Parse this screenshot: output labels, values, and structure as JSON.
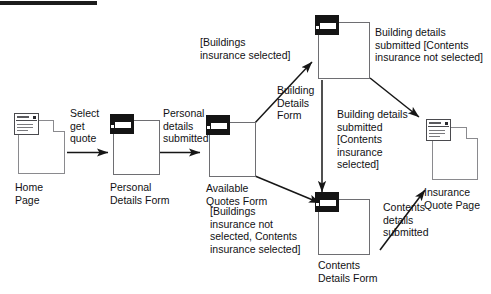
{
  "diagram": {
    "type": "navigation-state-diagram",
    "stroke_color": "#161616",
    "node_border_color": "#6e6e72",
    "badge_fill_color": "#141414",
    "background_color": "#ffffff"
  },
  "nodes": [
    {
      "id": "home-page",
      "label": "Home\nPage",
      "kind": "page"
    },
    {
      "id": "personal-details-form",
      "label": "Personal\nDetails Form",
      "kind": "form"
    },
    {
      "id": "available-quotes-form",
      "label": "Available\nQuotes Form",
      "kind": "form"
    },
    {
      "id": "building-details-form",
      "label": "Building\nDetails\nForm",
      "kind": "form"
    },
    {
      "id": "contents-details-form",
      "label": "Contents\nDetails Form",
      "kind": "form"
    },
    {
      "id": "insurance-quote-page",
      "label": "Insurance\nQuote Page",
      "kind": "page"
    }
  ],
  "edges": [
    {
      "id": "e1",
      "from": "home-page",
      "to": "personal-details-form",
      "label": "Select\nget\nquote"
    },
    {
      "id": "e2",
      "from": "personal-details-form",
      "to": "available-quotes-form",
      "label": "Personal\ndetails\nsubmitted"
    },
    {
      "id": "e3",
      "from": "available-quotes-form",
      "to": "building-details-form",
      "label": "[Buildings\ninsurance selected]"
    },
    {
      "id": "e4",
      "from": "available-quotes-form",
      "to": "contents-details-form",
      "label": "[Buildings\ninsurance not\nselected, Contents\ninsurance selected]"
    },
    {
      "id": "e5",
      "from": "building-details-form",
      "to": "insurance-quote-page",
      "label": "Building details\nsubmitted [Contents\ninsurance not selected]"
    },
    {
      "id": "e6",
      "from": "building-details-form",
      "to": "contents-details-form",
      "label": "Building details\nsubmitted\n[Contents\ninsurance\nselected]"
    },
    {
      "id": "e7",
      "from": "contents-details-form",
      "to": "insurance-quote-page",
      "label": "Contents\ndetails\nsubmitted"
    }
  ]
}
